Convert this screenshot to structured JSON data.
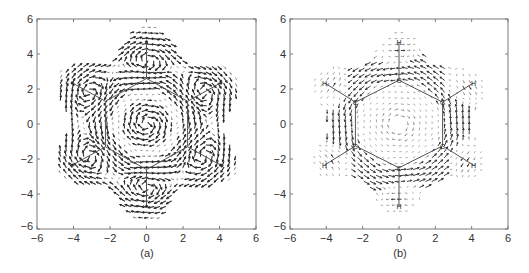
{
  "figure": {
    "panels": [
      {
        "id": "a",
        "caption": "(a)"
      },
      {
        "id": "b",
        "caption": "(b)"
      }
    ]
  },
  "chart_data": [
    {
      "type": "quiver",
      "title": "",
      "caption": "(a)",
      "xlabel": "",
      "ylabel": "",
      "xlim": [
        -6,
        6
      ],
      "ylim": [
        -6,
        6
      ],
      "xticks": [
        -6,
        -4,
        -2,
        0,
        2,
        4,
        6
      ],
      "yticks": [
        -6,
        -4,
        -2,
        0,
        2,
        4,
        6
      ],
      "grid": false,
      "legend": null,
      "molecule": {
        "name": "benzene",
        "carbon_ring_radius": 2.6,
        "hydrogen_radius": 4.7,
        "carbons": [
          [
            0,
            2.6
          ],
          [
            2.25,
            1.3
          ],
          [
            2.25,
            -1.3
          ],
          [
            0,
            -2.6
          ],
          [
            -2.25,
            -1.3
          ],
          [
            -2.25,
            1.3
          ]
        ],
        "hydrogens": [
          [
            0,
            4.7
          ],
          [
            4.07,
            2.35
          ],
          [
            4.07,
            -2.35
          ],
          [
            0,
            -4.7
          ],
          [
            -4.07,
            -2.35
          ],
          [
            -4.07,
            2.35
          ]
        ],
        "show_atom_labels": false
      },
      "field": {
        "description": "Current density vector field, dense diamagnetic circulation around carbon ring with local vortices near each C-H bond",
        "envelope": "six-lobed star shape extending to radius ~5.6 at lobes",
        "central_vortex": "clockwise",
        "arrow_density": "high, heavy arrows near ring"
      }
    },
    {
      "type": "quiver",
      "title": "",
      "caption": "(b)",
      "xlabel": "",
      "ylabel": "",
      "xlim": [
        -6,
        6
      ],
      "ylim": [
        -6,
        6
      ],
      "xticks": [
        -6,
        -4,
        -2,
        0,
        2,
        4,
        6
      ],
      "yticks": [
        -6,
        -4,
        -2,
        0,
        2,
        4,
        6
      ],
      "grid": false,
      "legend": null,
      "molecule": {
        "name": "benzene",
        "carbon_ring_radius": 2.5,
        "hydrogen_radius": 4.7,
        "carbons": [
          [
            0,
            2.5
          ],
          [
            2.4,
            1.25
          ],
          [
            2.4,
            -1.25
          ],
          [
            0,
            -2.5
          ],
          [
            -2.4,
            -1.25
          ],
          [
            -2.4,
            1.25
          ]
        ],
        "hydrogens": [
          [
            0,
            4.7
          ],
          [
            4.1,
            2.35
          ],
          [
            4.1,
            -2.35
          ],
          [
            0,
            -4.7
          ],
          [
            -4.1,
            -2.35
          ],
          [
            -4.1,
            2.35
          ]
        ],
        "atom_labels": {
          "carbon": "C",
          "hydrogen": "H"
        },
        "show_atom_labels": true
      },
      "field": {
        "description": "Current density vector field with strong circulation along the C6 ring (hexagonal band) and weak counter-circulation in the interior",
        "envelope": "six-lobed star shape extending to radius ~5.3 at lobes",
        "ring_circulation": "counterclockwise along outer band",
        "arrow_density": "medium, light arrows"
      }
    }
  ],
  "colors": {
    "axis": "#7a7a7a",
    "arrow_dark": "#2a2a2a",
    "arrow_light": "#6e6e6e",
    "bond": "#555555",
    "text": "#333333",
    "background": "#ffffff"
  }
}
